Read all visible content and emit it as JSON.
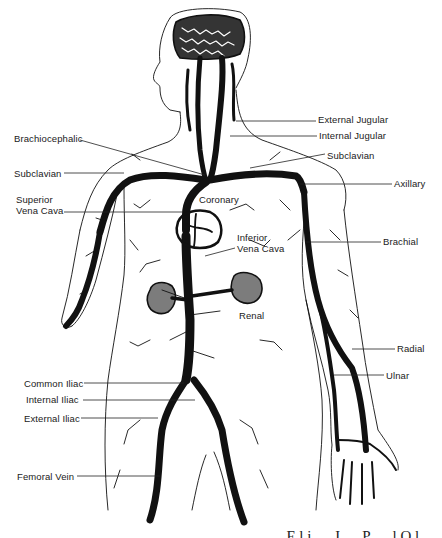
{
  "diagram": {
    "colors": {
      "ink": "#111111",
      "background": "#ffffff",
      "label": "#1a1a1a"
    },
    "labels": [
      {
        "id": "external-jugular",
        "text": "External Jugular",
        "x": 318,
        "y": 114,
        "side": "right",
        "line": [
          [
            236,
            121
          ],
          [
            316,
            121
          ]
        ]
      },
      {
        "id": "internal-jugular",
        "text": "Internal Jugular",
        "x": 319,
        "y": 130,
        "side": "right",
        "line": [
          [
            230,
            136
          ],
          [
            317,
            136
          ]
        ]
      },
      {
        "id": "subclavian-right",
        "text": "Subclavian",
        "x": 327,
        "y": 150,
        "side": "right",
        "line": [
          [
            250,
            168
          ],
          [
            325,
            154
          ]
        ]
      },
      {
        "id": "axillary",
        "text": "Axillary",
        "x": 394,
        "y": 178,
        "side": "right",
        "line": [
          [
            300,
            184
          ],
          [
            392,
            184
          ]
        ]
      },
      {
        "id": "brachial",
        "text": "Brachial",
        "x": 383,
        "y": 236,
        "side": "right",
        "line": [
          [
            305,
            242
          ],
          [
            381,
            242
          ]
        ]
      },
      {
        "id": "radial",
        "text": "Radial",
        "x": 397,
        "y": 343,
        "side": "right",
        "line": [
          [
            352,
            349
          ],
          [
            395,
            349
          ]
        ]
      },
      {
        "id": "ulnar",
        "text": "Ulnar",
        "x": 386,
        "y": 370,
        "side": "right",
        "line": [
          [
            334,
            375
          ],
          [
            384,
            375
          ]
        ]
      },
      {
        "id": "brachiocephalic",
        "text": "Brachiocephalic",
        "x": 14,
        "y": 133,
        "side": "left",
        "line": [
          [
            80,
            140
          ],
          [
            205,
            175
          ]
        ]
      },
      {
        "id": "subclavian-left",
        "text": "Subclavian",
        "x": 14,
        "y": 168,
        "side": "left",
        "line": [
          [
            64,
            173
          ],
          [
            124,
            173
          ]
        ]
      },
      {
        "id": "superior-vena-cava",
        "text": "Superior\nVena Cava",
        "x": 16,
        "y": 194,
        "side": "left",
        "line": [
          [
            64,
            212
          ],
          [
            183,
            212
          ]
        ]
      },
      {
        "id": "coronary",
        "text": "Coronary",
        "x": 199,
        "y": 194,
        "side": "inline",
        "line": null
      },
      {
        "id": "inferior-vena-cava",
        "text": "Inferior\nVena Cava",
        "x": 237,
        "y": 232,
        "side": "inline",
        "line": [
          [
            235,
            248
          ],
          [
            205,
            256
          ]
        ]
      },
      {
        "id": "renal",
        "text": "Renal",
        "x": 239,
        "y": 310,
        "side": "inline",
        "line": null
      },
      {
        "id": "common-iliac",
        "text": "Common Iliac",
        "x": 24,
        "y": 378,
        "side": "left",
        "line": [
          [
            84,
            383
          ],
          [
            184,
            383
          ]
        ]
      },
      {
        "id": "internal-iliac",
        "text": "Internal Iliac",
        "x": 26,
        "y": 394,
        "side": "left",
        "line": [
          [
            83,
            400
          ],
          [
            195,
            400
          ]
        ]
      },
      {
        "id": "external-iliac",
        "text": "External Iliac",
        "x": 24,
        "y": 413,
        "side": "left",
        "line": [
          [
            81,
            418
          ],
          [
            158,
            418
          ]
        ]
      },
      {
        "id": "femoral-vein",
        "text": "Femoral Vein",
        "x": 17,
        "y": 471,
        "side": "left",
        "line": [
          [
            77,
            476
          ],
          [
            160,
            476
          ]
        ]
      }
    ],
    "caption_fragment": "… E l i … J … P … l  O l …"
  }
}
